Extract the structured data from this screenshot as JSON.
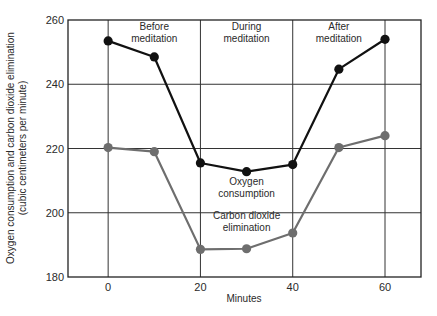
{
  "chart_data": {
    "type": "line",
    "title": "",
    "xlabel": "Minutes",
    "ylabel": "Oxygen consumption and carbon dioxide elimination",
    "ylabel_sub": "(cubic centimeters per minute)",
    "x": [
      0,
      10,
      20,
      30,
      40,
      50,
      60
    ],
    "xlim": [
      -8.7,
      67.8
    ],
    "ylim": [
      180,
      260
    ],
    "xticks": [
      0,
      20,
      40,
      60
    ],
    "yticks": [
      180,
      200,
      220,
      240,
      260
    ],
    "grid": true,
    "series": [
      {
        "name": "Oxygen consumption",
        "color": "#111111",
        "values": [
          253.5,
          248.5,
          215.5,
          212.8,
          215.0,
          244.7,
          254.0
        ]
      },
      {
        "name": "Carbon dioxide elimination",
        "color": "#6e6e6e",
        "values": [
          220.3,
          219.0,
          188.6,
          188.8,
          193.7,
          220.3,
          224.0
        ]
      }
    ],
    "annotations": [
      {
        "text": [
          "Before",
          "meditation"
        ],
        "x": 10,
        "y": 257
      },
      {
        "text": [
          "During",
          "meditation"
        ],
        "x": 30,
        "y": 257
      },
      {
        "text": [
          "After",
          "meditation"
        ],
        "x": 50,
        "y": 257
      },
      {
        "text": [
          "Oxygen",
          "consumption"
        ],
        "x": 30,
        "y": 208.5
      },
      {
        "text": [
          "Carbon dioxide",
          "elimination"
        ],
        "x": 30,
        "y": 198
      }
    ]
  }
}
